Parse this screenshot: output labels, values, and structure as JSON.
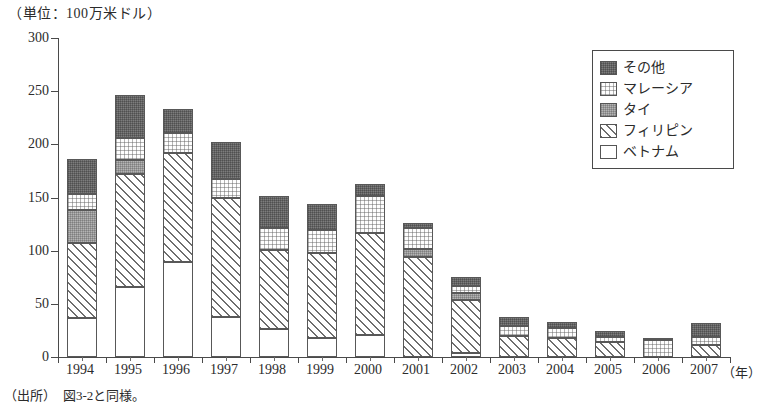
{
  "unit_caption": "（単位：100万米ドル）",
  "year_axis_unit": "（年）",
  "source_note": "（出所）　図3-2と同様。",
  "legend": {
    "position": "top-right",
    "items": [
      {
        "label": "その他",
        "pattern": "pat-other",
        "color": "#7d7d7d"
      },
      {
        "label": "マレーシア",
        "pattern": "pat-malaysia",
        "color": "#fdfdfd"
      },
      {
        "label": "タイ",
        "pattern": "pat-thailand",
        "color": "#b4b4b4"
      },
      {
        "label": "フィリピン",
        "pattern": "pat-philippines",
        "color": "#ffffff"
      },
      {
        "label": "ベトナム",
        "pattern": "pat-vietnam",
        "color": "#ffffff"
      }
    ]
  },
  "chart_data": {
    "type": "bar",
    "stacked": true,
    "title": "",
    "subtitle": "",
    "xlabel": "（年）",
    "ylabel": "（単位：100万米ドル）",
    "grid": false,
    "ylim": [
      0,
      300
    ],
    "ytick_labels": [
      "300",
      "250",
      "200",
      "150",
      "100",
      "50",
      "0"
    ],
    "ytick_values": [
      300,
      250,
      200,
      150,
      100,
      50,
      0
    ],
    "categories": [
      "1994",
      "1995",
      "1996",
      "1997",
      "1998",
      "1999",
      "2000",
      "2001",
      "2002",
      "2003",
      "2004",
      "2005",
      "2006",
      "2007"
    ],
    "stack_order_bottom_to_top": [
      "ベトナム",
      "フィリピン",
      "タイ",
      "マレーシア",
      "その他"
    ],
    "series": [
      {
        "name": "ベトナム",
        "pattern": "pat-vietnam",
        "values": [
          37,
          66,
          89,
          38,
          26,
          18,
          21,
          0,
          4,
          0,
          0,
          0,
          0,
          0
        ]
      },
      {
        "name": "フィリピン",
        "pattern": "pat-philippines",
        "values": [
          70,
          106,
          103,
          112,
          75,
          80,
          96,
          94,
          50,
          20,
          18,
          14,
          0,
          11
        ]
      },
      {
        "name": "タイ",
        "pattern": "pat-thailand",
        "values": [
          31,
          13,
          0,
          0,
          0,
          0,
          0,
          8,
          6,
          0,
          0,
          0,
          0,
          0
        ]
      },
      {
        "name": "マレーシア",
        "pattern": "pat-malaysia",
        "values": [
          15,
          21,
          19,
          17,
          20,
          21,
          34,
          19,
          7,
          9,
          9,
          5,
          16,
          8
        ]
      },
      {
        "name": "その他",
        "pattern": "pat-other",
        "values": [
          33,
          40,
          22,
          35,
          30,
          25,
          12,
          5,
          8,
          9,
          6,
          5,
          2,
          13
        ]
      }
    ],
    "totals": [
      186,
      246,
      233,
      202,
      151,
      144,
      163,
      126,
      75,
      38,
      33,
      24,
      18,
      32
    ]
  }
}
